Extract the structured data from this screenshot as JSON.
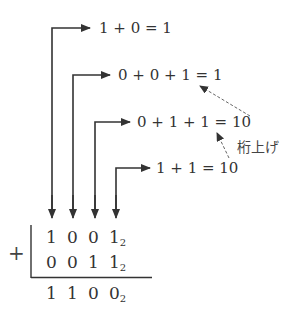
{
  "equations": [
    {
      "text": "1 + 0 = 1"
    },
    {
      "text": "0 + 0 + 1 = 1"
    },
    {
      "text": "0 + 1 + 1 = 10"
    },
    {
      "text": "1 + 1 = 10"
    }
  ],
  "carry_label": "桁上げ",
  "addition": {
    "operator": "+",
    "row1": {
      "digits": [
        "1",
        "0",
        "0",
        "1"
      ],
      "base": "2"
    },
    "row2": {
      "digits": [
        "0",
        "0",
        "1",
        "1"
      ],
      "base": "2"
    },
    "result": {
      "digits": [
        "1",
        "1",
        "0",
        "0"
      ],
      "base": "2"
    }
  },
  "colors": {
    "ink": "#333333",
    "dashed": "#666666"
  }
}
